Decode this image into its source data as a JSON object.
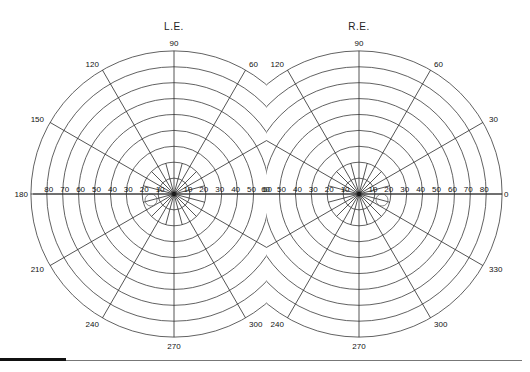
{
  "chart_data": {
    "type": "polar-grid",
    "eyes": [
      {
        "id": "left",
        "label": "L.E.",
        "center": [
          174,
          194
        ],
        "blind_spot": {
          "cx": 151,
          "cy": 200,
          "r": 6
        },
        "meridian_labels": [
          "90",
          "120",
          "60",
          "150",
          "180",
          "210",
          "240",
          "270",
          "300"
        ],
        "eccentricity_labels_temporal": [
          "80",
          "70",
          "60",
          "50",
          "40",
          "30",
          "20",
          "10"
        ],
        "eccentricity_labels_nasal": [
          "10",
          "20",
          "30",
          "40",
          "50",
          "60"
        ]
      },
      {
        "id": "right",
        "label": "R.E.",
        "center": [
          359,
          194
        ],
        "blind_spot": {
          "cx": 382,
          "cy": 200,
          "r": 6
        },
        "meridian_labels": [
          "90",
          "120",
          "60",
          "30",
          "0",
          "330",
          "240",
          "270",
          "300"
        ],
        "eccentricity_labels_nasal": [
          "60",
          "50",
          "40",
          "30",
          "20",
          "10"
        ],
        "eccentricity_labels_temporal": [
          "10",
          "20",
          "30",
          "40",
          "50",
          "60",
          "70",
          "80"
        ]
      }
    ],
    "rings_degrees": [
      10,
      20,
      30,
      40,
      50,
      60,
      70,
      80,
      90
    ],
    "ring_spacing_px": 15.9,
    "meridians_degrees": [
      0,
      30,
      60,
      90,
      120,
      150,
      180,
      210,
      240,
      270,
      300,
      330
    ],
    "grid": true
  },
  "labels": {
    "left_eye": "L.E.",
    "right_eye": "R.E."
  }
}
